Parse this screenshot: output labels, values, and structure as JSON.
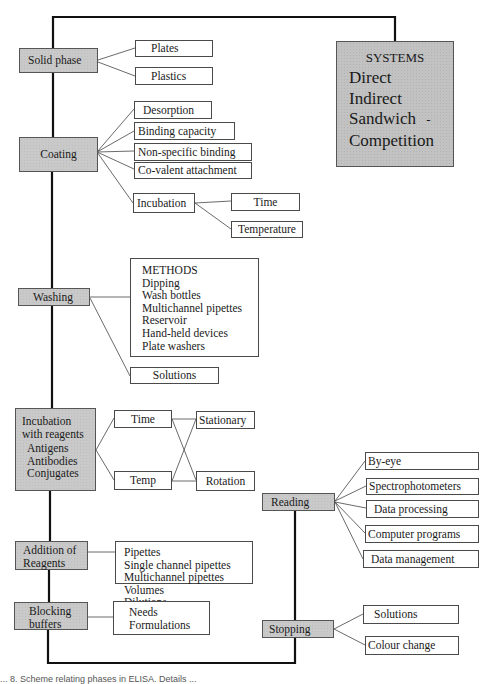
{
  "systems": {
    "title": "SYSTEMS",
    "items": [
      "Direct",
      "Indirect",
      "Sandwich",
      "Competition"
    ],
    "dash": "-"
  },
  "stages": {
    "solid_phase": {
      "label": "Solid phase",
      "children": [
        "Plates",
        "Plastics"
      ]
    },
    "coating": {
      "label": "Coating",
      "children": [
        "Desorption",
        "Binding capacity",
        "Non-specific binding",
        "Co-valent attachment",
        "Incubation"
      ],
      "incubation_children": [
        "Time",
        "Temperature"
      ]
    },
    "washing": {
      "label": "Washing",
      "methods": [
        "METHODS",
        "Dipping",
        "Wash bottles",
        "Multichannel pipettes",
        "Reservoir",
        "Hand-held devices",
        "Plate washers"
      ],
      "solutions": "Solutions"
    },
    "incubation_reagents": {
      "label_lines": [
        "Incubation",
        "with reagents"
      ],
      "sub_lines": [
        "Antigens",
        "Antibodies",
        "Conjugates"
      ],
      "params": [
        "Time",
        "Temp"
      ],
      "modes": [
        "Stationary",
        "Rotation"
      ]
    },
    "addition": {
      "label_lines": [
        "Addition of",
        "Reagents"
      ],
      "details": [
        "Pipettes",
        "Single channel pipettes",
        "Multichannel pipettes",
        "Volumes",
        "Dilutions"
      ]
    },
    "blocking": {
      "label_lines": [
        "Blocking",
        "buffers"
      ],
      "details": [
        "Needs",
        "Formulations"
      ]
    },
    "reading": {
      "label": "Reading",
      "children": [
        "By-eye",
        "Spectrophotometers",
        "Data processing",
        "Computer programs",
        "Data management"
      ]
    },
    "stopping": {
      "label": "Stopping",
      "children": [
        "Solutions",
        "Colour change"
      ]
    }
  },
  "caption": "... 8.  Scheme relating phases in ELISA. Details ..."
}
